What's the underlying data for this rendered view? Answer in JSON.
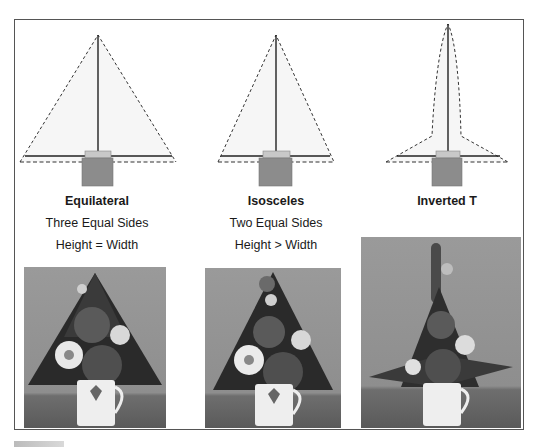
{
  "figure": {
    "panels": [
      {
        "id": "equilateral",
        "title": "Equilateral",
        "line1": "Three Equal Sides",
        "line2": "Height = Width",
        "photo_alt": "Equilateral triangle floral arrangement in a mug"
      },
      {
        "id": "isosceles",
        "title": "Isosceles",
        "line1": "Two Equal Sides",
        "line2": "Height > Width",
        "photo_alt": "Isosceles triangle floral arrangement in a mug"
      },
      {
        "id": "inverted-t",
        "title": "Inverted T",
        "line1": "",
        "line2": "",
        "photo_alt": "Inverted T floral arrangement in a mug"
      }
    ],
    "colors": {
      "frame": "#555555",
      "outline_dash": "#333333",
      "axis_line": "#222222",
      "vase_lid": "#c8c8c8",
      "vase_body": "#8c8c8c",
      "shape_fill": "#f6f6f6"
    }
  }
}
